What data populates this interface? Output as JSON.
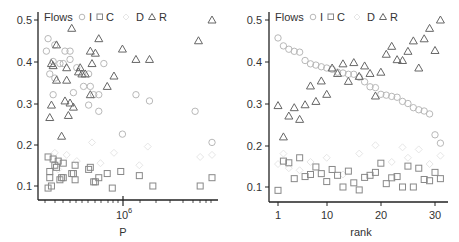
{
  "chart_data": [
    {
      "type": "scatter",
      "title": "",
      "xlabel": "P",
      "ylabel": "",
      "xscale": "log",
      "x_tick_labels": [
        "10^6"
      ],
      "y_tick_labels": [
        "0.1",
        "0.2",
        "0.3",
        "0.4",
        "0.5"
      ],
      "ylim": [
        0.08,
        0.52
      ],
      "legend": {
        "title": "Flows",
        "entries": [
          "I",
          "C",
          "D",
          "R"
        ],
        "position": "top"
      },
      "note": "x positions given as fraction of the log-P axis span (0 = left, 1 = right; 10^6 at 0.47)",
      "series": [
        {
          "name": "I",
          "marker": "circle",
          "color": "#b8b8b8",
          "points": [
            [
              0.03,
              0.455
            ],
            [
              0.02,
              0.425
            ],
            [
              0.07,
              0.44
            ],
            [
              0.13,
              0.425
            ],
            [
              0.16,
              0.425
            ],
            [
              0.06,
              0.4
            ],
            [
              0.1,
              0.395
            ],
            [
              0.16,
              0.405
            ],
            [
              0.04,
              0.37
            ],
            [
              0.07,
              0.36
            ],
            [
              0.12,
              0.395
            ],
            [
              0.2,
              0.385
            ],
            [
              0.27,
              0.37
            ],
            [
              0.36,
              0.395
            ],
            [
              0.24,
              0.34
            ],
            [
              0.28,
              0.34
            ],
            [
              0.06,
              0.32
            ],
            [
              0.18,
              0.325
            ],
            [
              0.3,
              0.32
            ],
            [
              0.33,
              0.32
            ],
            [
              0.55,
              0.32
            ],
            [
              0.63,
              0.305
            ],
            [
              0.27,
              0.295
            ],
            [
              0.33,
              0.28
            ],
            [
              0.9,
              0.28
            ],
            [
              0.47,
              0.225
            ],
            [
              1.0,
              0.205
            ]
          ]
        },
        {
          "name": "C",
          "marker": "square",
          "color": "#888888",
          "points": [
            [
              0.03,
              0.17
            ],
            [
              0.06,
              0.165
            ],
            [
              0.09,
              0.16
            ],
            [
              0.12,
              0.155
            ],
            [
              0.04,
              0.135
            ],
            [
              0.07,
              0.15
            ],
            [
              0.08,
              0.145
            ],
            [
              0.19,
              0.15
            ],
            [
              0.28,
              0.145
            ],
            [
              0.27,
              0.14
            ],
            [
              0.17,
              0.13
            ],
            [
              0.18,
              0.13
            ],
            [
              0.38,
              0.13
            ],
            [
              0.46,
              0.135
            ],
            [
              0.57,
              0.125
            ],
            [
              0.1,
              0.115
            ],
            [
              0.19,
              0.115
            ],
            [
              0.11,
              0.12
            ],
            [
              0.12,
              0.12
            ],
            [
              0.3,
              0.11
            ],
            [
              0.31,
              0.11
            ],
            [
              0.33,
              0.12
            ],
            [
              0.04,
              0.12
            ],
            [
              0.05,
              0.1
            ],
            [
              0.03,
              0.095
            ],
            [
              0.41,
              0.095
            ],
            [
              0.65,
              0.1
            ],
            [
              0.93,
              0.1
            ],
            [
              1.0,
              0.12
            ]
          ]
        },
        {
          "name": "D",
          "marker": "diamond",
          "color": "#e6e6e6",
          "points": [
            [
              0.07,
              0.18
            ],
            [
              0.14,
              0.175
            ],
            [
              0.29,
              0.205
            ],
            [
              0.42,
              0.18
            ],
            [
              0.62,
              0.195
            ],
            [
              0.93,
              0.17
            ],
            [
              1.0,
              0.175
            ],
            [
              0.09,
              0.14
            ],
            [
              0.2,
              0.16
            ],
            [
              0.34,
              0.155
            ],
            [
              0.57,
              0.15
            ]
          ]
        },
        {
          "name": "R",
          "marker": "triangle",
          "color": "#666666",
          "points": [
            [
              0.17,
              0.48
            ],
            [
              1.0,
              0.5
            ],
            [
              0.33,
              0.455
            ],
            [
              0.92,
              0.45
            ],
            [
              0.08,
              0.44
            ],
            [
              0.28,
              0.425
            ],
            [
              0.31,
              0.42
            ],
            [
              0.47,
              0.43
            ],
            [
              0.55,
              0.405
            ],
            [
              0.63,
              0.405
            ],
            [
              0.05,
              0.395
            ],
            [
              0.06,
              0.39
            ],
            [
              0.14,
              0.385
            ],
            [
              0.22,
              0.385
            ],
            [
              0.29,
              0.395
            ],
            [
              0.21,
              0.375
            ],
            [
              0.23,
              0.37
            ],
            [
              0.25,
              0.37
            ],
            [
              0.08,
              0.355
            ],
            [
              0.14,
              0.355
            ],
            [
              0.42,
              0.365
            ],
            [
              0.38,
              0.34
            ],
            [
              0.28,
              0.32
            ],
            [
              0.05,
              0.295
            ],
            [
              0.13,
              0.305
            ],
            [
              0.16,
              0.3
            ],
            [
              0.18,
              0.29
            ],
            [
              0.15,
              0.27
            ],
            [
              0.04,
              0.265
            ],
            [
              0.11,
              0.22
            ]
          ]
        }
      ]
    },
    {
      "type": "scatter",
      "title": "",
      "xlabel": "rank",
      "ylabel": "",
      "x_ticks": [
        1,
        10,
        20,
        30
      ],
      "xlim": [
        0,
        32
      ],
      "y_tick_labels": [
        "0.1",
        "0.2",
        "0.3",
        "0.4",
        "0.5"
      ],
      "ylim": [
        0.08,
        0.52
      ],
      "legend": {
        "title": "Flows",
        "entries": [
          "I",
          "C",
          "D",
          "R"
        ],
        "position": "top"
      },
      "series": [
        {
          "name": "I",
          "marker": "circle",
          "color": "#b8b8b8",
          "x": [
            1,
            2,
            3,
            4,
            5,
            6,
            7,
            8,
            9,
            10,
            11,
            12,
            13,
            14,
            15,
            16,
            17,
            18,
            19,
            20,
            21,
            22,
            23,
            24,
            25,
            26,
            27,
            28,
            29,
            30,
            31
          ],
          "values": [
            0.457,
            0.438,
            0.43,
            0.425,
            0.423,
            0.403,
            0.395,
            0.392,
            0.388,
            0.385,
            0.382,
            0.375,
            0.373,
            0.37,
            0.37,
            0.363,
            0.352,
            0.34,
            0.338,
            0.322,
            0.32,
            0.317,
            0.315,
            0.305,
            0.3,
            0.29,
            0.285,
            0.282,
            0.275,
            0.225,
            0.205
          ]
        },
        {
          "name": "C",
          "marker": "square",
          "color": "#888888",
          "x": [
            1,
            2,
            3,
            4,
            5,
            6,
            7,
            8,
            9,
            10,
            11,
            12,
            13,
            14,
            15,
            16,
            17,
            18,
            19,
            20,
            21,
            22,
            23,
            24,
            25,
            26,
            27,
            28,
            29,
            30,
            31
          ],
          "values": [
            0.092,
            0.162,
            0.158,
            0.12,
            0.17,
            0.125,
            0.13,
            0.148,
            0.132,
            0.113,
            0.142,
            0.128,
            0.1,
            0.138,
            0.11,
            0.093,
            0.123,
            0.128,
            0.135,
            0.157,
            0.108,
            0.122,
            0.125,
            0.1,
            0.15,
            0.1,
            0.145,
            0.118,
            0.115,
            0.135,
            0.12
          ]
        },
        {
          "name": "D",
          "marker": "diamond",
          "color": "#e6e6e6",
          "x": [
            1,
            2,
            3,
            5,
            7,
            10,
            13,
            16,
            19,
            22,
            24,
            25,
            27,
            29,
            31
          ],
          "values": [
            0.155,
            0.18,
            0.145,
            0.14,
            0.16,
            0.17,
            0.13,
            0.18,
            0.2,
            0.16,
            0.195,
            0.17,
            0.19,
            0.155,
            0.175
          ]
        },
        {
          "name": "R",
          "marker": "triangle",
          "color": "#666666",
          "x": [
            1,
            2,
            3,
            4,
            5,
            6,
            7,
            8,
            9,
            10,
            11,
            12,
            13,
            14,
            15,
            16,
            17,
            18,
            19,
            20,
            21,
            22,
            23,
            24,
            25,
            26,
            27,
            28,
            29,
            30,
            31
          ],
          "values": [
            0.295,
            0.22,
            0.27,
            0.29,
            0.262,
            0.297,
            0.342,
            0.305,
            0.354,
            0.322,
            0.385,
            0.372,
            0.395,
            0.353,
            0.398,
            0.365,
            0.39,
            0.372,
            0.318,
            0.375,
            0.418,
            0.437,
            0.405,
            0.403,
            0.425,
            0.45,
            0.385,
            0.455,
            0.48,
            0.427,
            0.5
          ]
        }
      ]
    }
  ],
  "panels": [
    {
      "legend_title": "Flows",
      "legend_labels": [
        "I",
        "C",
        "D",
        "R"
      ],
      "xlabel": "P",
      "xtick_main": "10",
      "xtick_exp": "6",
      "yticks": [
        "0.5",
        "0.4",
        "0.3",
        "0.2",
        "0.1"
      ]
    },
    {
      "legend_title": "Flows",
      "legend_labels": [
        "I",
        "C",
        "D",
        "R"
      ],
      "xlabel": "rank",
      "xticks": [
        "1",
        "10",
        "20",
        "30"
      ],
      "yticks": [
        "0.5",
        "0.4",
        "0.3",
        "0.2",
        "0.1"
      ]
    }
  ],
  "colors": {
    "I": "#b8b8b8",
    "C": "#888888",
    "D": "#e6e6e6",
    "R": "#666666",
    "axis": "#222222"
  }
}
